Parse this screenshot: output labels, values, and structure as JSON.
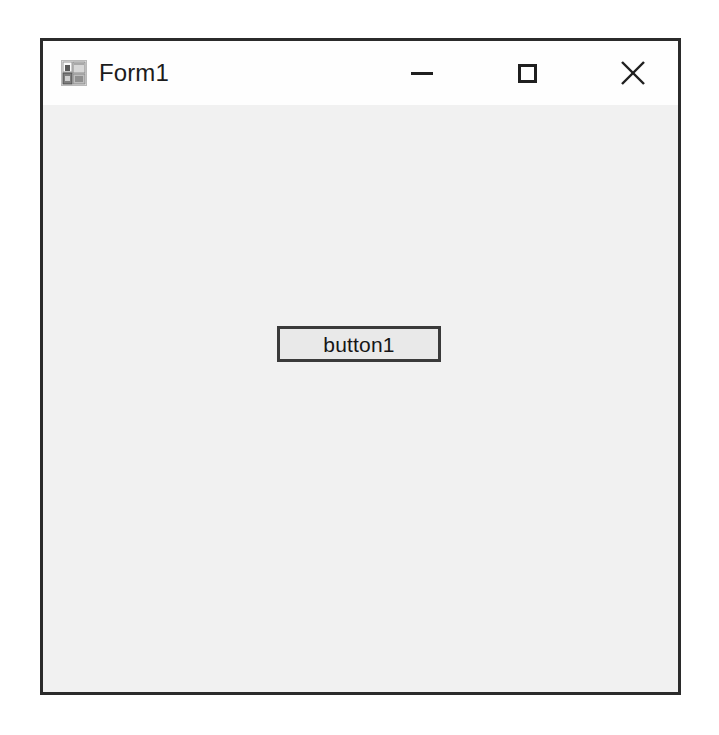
{
  "window": {
    "title": "Form1",
    "icon": "winforms-designer-icon",
    "frame_color": "#2b2b2b",
    "titlebar_color": "#fefefe",
    "client_color": "#f1f1f1"
  },
  "window_controls": [
    {
      "name": "minimize",
      "glyph": "—",
      "label": "Minimize"
    },
    {
      "name": "maximize",
      "glyph": "□",
      "label": "Maximize"
    },
    {
      "name": "close",
      "glyph": "×",
      "label": "Close"
    }
  ],
  "client": {
    "controls": [
      {
        "type": "button",
        "name": "button1",
        "text": "button1",
        "border_color": "#3a3a3a",
        "fill_color": "#e9e9e9"
      }
    ]
  }
}
